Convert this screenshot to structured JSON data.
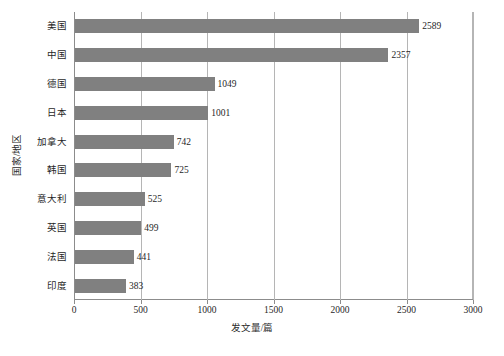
{
  "chart_data": {
    "type": "bar",
    "orientation": "horizontal",
    "title": "",
    "xlabel": "发文量/篇",
    "ylabel": "国家/地区",
    "categories": [
      "美国",
      "中国",
      "德国",
      "日本",
      "加拿大",
      "韩国",
      "意大利",
      "英国",
      "法国",
      "印度"
    ],
    "values": [
      2589,
      2357,
      1049,
      1001,
      742,
      725,
      525,
      499,
      441,
      383
    ],
    "value_labels": [
      "2589",
      "2357",
      "1049",
      "1001",
      "742",
      "725",
      "525",
      "499",
      "441",
      "383"
    ],
    "xlim": [
      0,
      3000
    ],
    "xticks": [
      0,
      500,
      1000,
      1500,
      2000,
      2500,
      3000
    ],
    "xtick_labels": [
      "0",
      "500",
      "1000",
      "1500",
      "2000",
      "2500",
      "3000"
    ],
    "grid": "vertical",
    "legend": null,
    "bar_color": "#808080",
    "gridline_color": "#b5b5b5",
    "axis_color": "#8c8c8c"
  },
  "figure": {
    "caption": ""
  }
}
